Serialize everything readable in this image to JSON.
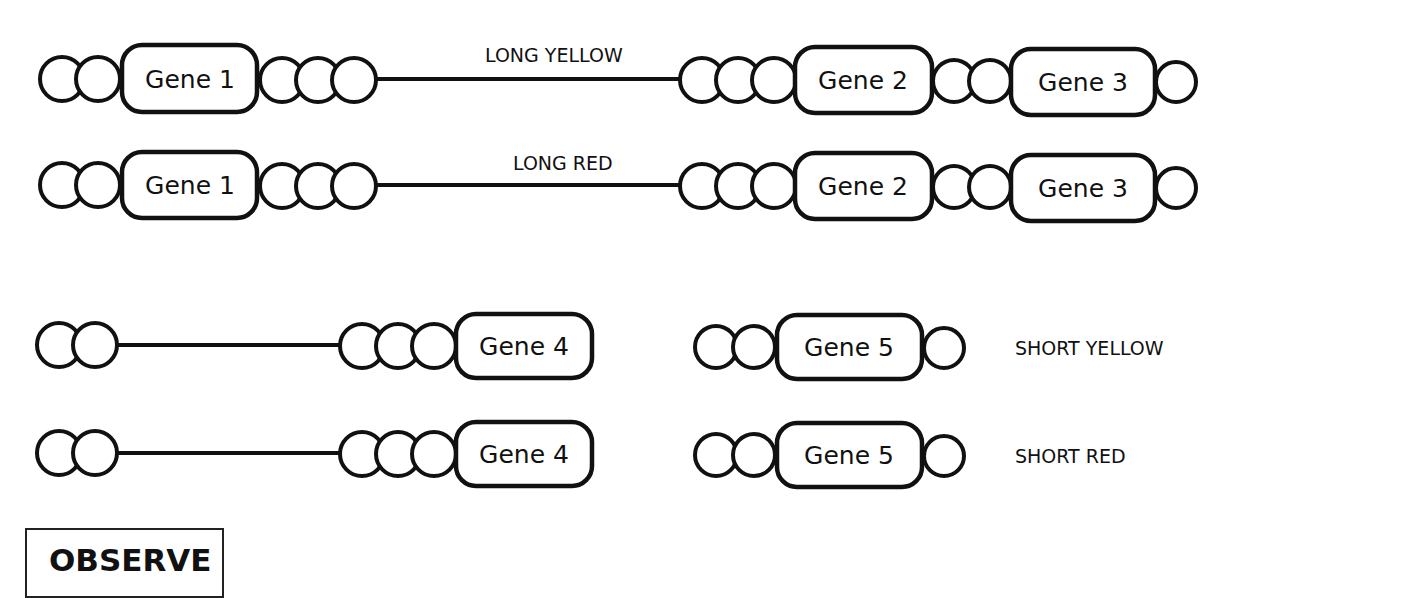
{
  "diagram": {
    "rows": [
      {
        "id": "long-yellow",
        "label": "LONG YELLOW",
        "genes": [
          "Gene 1",
          "Gene 2",
          "Gene 3"
        ]
      },
      {
        "id": "long-red",
        "label": "LONG RED",
        "genes": [
          "Gene 1",
          "Gene 2",
          "Gene 3"
        ]
      },
      {
        "id": "short-yellow",
        "label": "SHORT YELLOW",
        "genes": [
          "Gene 4",
          "Gene 5"
        ]
      },
      {
        "id": "short-red",
        "label": "SHORT RED",
        "genes": [
          "Gene 4",
          "Gene 5"
        ]
      }
    ],
    "observe_label": "OBSERVE",
    "colors": {
      "stroke": "#111111",
      "background": "#ffffff"
    }
  }
}
